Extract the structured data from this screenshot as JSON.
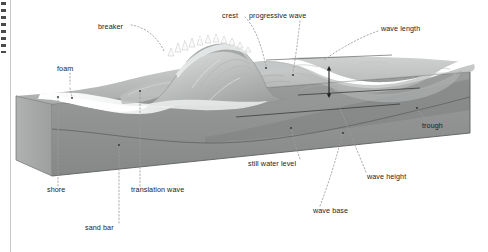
{
  "figure": {
    "type": "diagram",
    "width": 488,
    "height": 252,
    "background": "#ffffff",
    "text_color": "#1c1c1c",
    "leader_line_style": "dotted",
    "leader_line_color": "#9a9a9a"
  },
  "palette": {
    "sky": "#ffffff",
    "water_surface_light": "#c9cbcb",
    "water_surface_mid": "#b4b7b6",
    "water_body": "#9a9c9b",
    "water_deep": "#7d807f",
    "seabed_top": "#b9bab8",
    "block_front": "#8f9190",
    "block_left": "#a7a9a8",
    "block_edge": "#6a6c6b",
    "foam": "#f2f3f3",
    "wave_face": "#d4d6d6",
    "outline": "#5c5e5d"
  },
  "labels": [
    {
      "id": "breaker",
      "text": "breaker",
      "x": 98,
      "y": 27,
      "anchor": "right",
      "target_x": 163,
      "target_y": 52
    },
    {
      "id": "crest",
      "text": "crest",
      "x": 222,
      "y": 16,
      "anchor": "right",
      "target_x": 266,
      "target_y": 68
    },
    {
      "id": "progressive-wave",
      "text": "progressive wave",
      "x": 277,
      "y": 16,
      "anchor": "left",
      "target_x": 293,
      "target_y": 75
    },
    {
      "id": "wave-length",
      "text": "wave length",
      "x": 381,
      "y": 29,
      "anchor": "left",
      "target_x": 322,
      "target_y": 62
    },
    {
      "id": "foam",
      "text": "foam",
      "x": 57,
      "y": 69,
      "anchor": "left",
      "target_x": 76,
      "target_y": 99
    },
    {
      "id": "trough",
      "text": "trough",
      "x": 422,
      "y": 127,
      "anchor": "left",
      "target_x": 417,
      "target_y": 110
    },
    {
      "id": "still-water-level",
      "text": "still water level",
      "x": 248,
      "y": 164,
      "anchor": "left",
      "target_x": 290,
      "target_y": 128
    },
    {
      "id": "wave-height",
      "text": "wave height",
      "x": 367,
      "y": 177,
      "anchor": "left",
      "target_x": 334,
      "target_y": 95
    },
    {
      "id": "wave-base",
      "text": "wave base",
      "x": 313,
      "y": 211,
      "anchor": "left",
      "target_x": 343,
      "target_y": 133
    },
    {
      "id": "shore",
      "text": "shore",
      "x": 47,
      "y": 190,
      "anchor": "left",
      "target_x": 58,
      "target_y": 96
    },
    {
      "id": "translation-wave",
      "text": "translation wave",
      "x": 131,
      "y": 190,
      "anchor": "left",
      "target_x": 138,
      "target_y": 90
    },
    {
      "id": "sand bar",
      "text": "sand bar",
      "x": 85,
      "y": 228,
      "anchor": "left",
      "target_x": 119,
      "target_y": 145
    }
  ]
}
